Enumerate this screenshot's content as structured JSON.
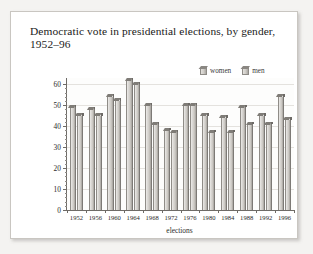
{
  "figure": {
    "title": "Democratic vote in presidential elections, by gender, 1952–96"
  },
  "legend": {
    "items": [
      {
        "label": "women",
        "icon": "bar-swatch-icon"
      },
      {
        "label": "men",
        "icon": "bar-swatch-icon"
      }
    ]
  },
  "chart_data": {
    "type": "bar",
    "title": "Democratic vote in presidential elections, by gender, 1952–96",
    "xlabel": "elections",
    "ylabel": "proportion of Democratic vote, in percent",
    "categories": [
      "1952",
      "1956",
      "1960",
      "1964",
      "1968",
      "1972",
      "1976",
      "1980",
      "1984",
      "1988",
      "1992",
      "1996"
    ],
    "series": [
      {
        "name": "women",
        "values": [
          49,
          48,
          54,
          62,
          50,
          38,
          50,
          45,
          44,
          49,
          45,
          54
        ]
      },
      {
        "name": "men",
        "values": [
          45,
          45,
          52,
          60,
          41,
          37,
          50,
          37,
          37,
          41,
          41,
          43
        ]
      }
    ],
    "ylim": [
      0,
      63
    ],
    "yticks": [
      0,
      10,
      20,
      30,
      40,
      50,
      60
    ],
    "ytick_labels": [
      "0",
      "10",
      "20",
      "30",
      "40",
      "50",
      "60"
    ],
    "grid": true,
    "legend_position": "top-right"
  }
}
